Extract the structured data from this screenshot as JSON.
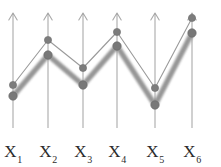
{
  "figure": {
    "width": 221,
    "height": 167,
    "background_color": "#ffffff"
  },
  "axes": {
    "count": 6,
    "icon": "up-arrow-axis",
    "color": "#a9a9a9",
    "x_positions": [
      13,
      48,
      83,
      117,
      155,
      192
    ],
    "tip_y": 13,
    "base_y": 128,
    "labels": [
      {
        "base": "X",
        "sub": "1"
      },
      {
        "base": "X",
        "sub": "2"
      },
      {
        "base": "X",
        "sub": "3"
      },
      {
        "base": "X",
        "sub": "4"
      },
      {
        "base": "X",
        "sub": "5"
      },
      {
        "base": "X",
        "sub": "6"
      }
    ]
  },
  "chart_data": {
    "type": "line",
    "title": "",
    "subtitle": "",
    "xlabel": "",
    "ylabel": "",
    "grid": false,
    "legend_position": "none",
    "categories": [
      "X1",
      "X2",
      "X3",
      "X4",
      "X5",
      "X6"
    ],
    "x_pixels": [
      13,
      48,
      83,
      117,
      155,
      192
    ],
    "axis_orientation": "value-increases-upward",
    "ylim": [
      0,
      100
    ],
    "series": [
      {
        "name": "thin-series",
        "style": "thin",
        "color": "#9a9a9a",
        "marker": "circle",
        "marker_radius": 3.6,
        "y_pixels": [
          85,
          40,
          68,
          32,
          88,
          18
        ],
        "values": [
          40,
          78,
          55,
          85,
          37,
          97
        ]
      },
      {
        "name": "thick-series",
        "style": "thick-blurred",
        "color": "#8d8d8d",
        "marker": "circle",
        "marker_radius": 4.2,
        "y_pixels": [
          96,
          55,
          85,
          46,
          105,
          33
        ],
        "values": [
          31,
          66,
          40,
          74,
          23,
          83
        ]
      }
    ]
  }
}
